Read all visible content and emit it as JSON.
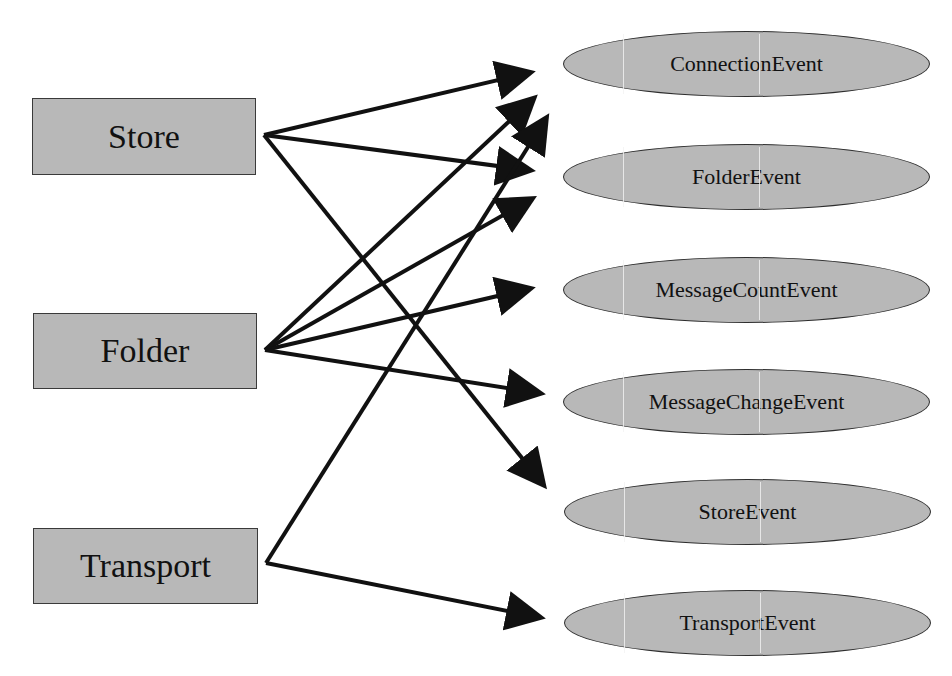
{
  "diagram": {
    "type": "event-source-relationship",
    "colors": {
      "node_fill": "#b8b8b8",
      "node_border": "#3a3a3a",
      "edge": "#111111",
      "background": "#ffffff"
    },
    "sources": [
      {
        "id": "store",
        "label": "Store"
      },
      {
        "id": "folder",
        "label": "Folder"
      },
      {
        "id": "transport",
        "label": "Transport"
      }
    ],
    "events": [
      {
        "id": "connection_event",
        "label": "ConnectionEvent"
      },
      {
        "id": "folder_event",
        "label": "FolderEvent"
      },
      {
        "id": "message_count_event",
        "label": "MessageCountEvent"
      },
      {
        "id": "message_change_event",
        "label": "MessageChangeEvent"
      },
      {
        "id": "store_event",
        "label": "StoreEvent"
      },
      {
        "id": "transport_event",
        "label": "TransportEvent"
      }
    ],
    "edges": [
      {
        "from": "store",
        "to": "connection_event"
      },
      {
        "from": "store",
        "to": "folder_event"
      },
      {
        "from": "store",
        "to": "store_event"
      },
      {
        "from": "folder",
        "to": "connection_event"
      },
      {
        "from": "folder",
        "to": "folder_event"
      },
      {
        "from": "folder",
        "to": "message_count_event"
      },
      {
        "from": "folder",
        "to": "message_change_event"
      },
      {
        "from": "transport",
        "to": "connection_event"
      },
      {
        "from": "transport",
        "to": "transport_event"
      }
    ]
  }
}
